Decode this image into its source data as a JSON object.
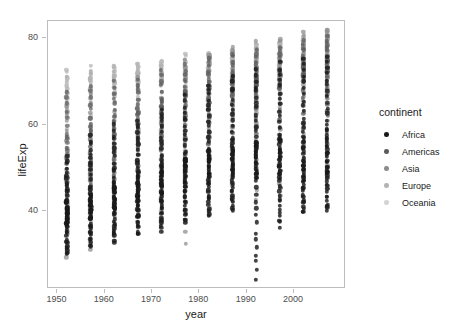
{
  "chart_data": {
    "type": "scatter",
    "title": "",
    "xlabel": "year",
    "ylabel": "lifeExp",
    "xlim": [
      1948,
      2011
    ],
    "ylim": [
      22,
      84
    ],
    "xticks": [
      1950,
      1960,
      1970,
      1980,
      1990,
      2000
    ],
    "yticks": [
      40,
      60,
      80
    ],
    "grid": false,
    "legend": {
      "position": "right",
      "title": "continent",
      "entries": [
        {
          "label": "Africa",
          "color": "#1a1a1a"
        },
        {
          "label": "Americas",
          "color": "#5c5c5c"
        },
        {
          "label": "Asia",
          "color": "#8c8c8c"
        },
        {
          "label": "Europe",
          "color": "#b3b3b3"
        },
        {
          "label": "Oceania",
          "color": "#d4d4d4"
        }
      ]
    },
    "color_by": "continent",
    "x_values": [
      1952,
      1957,
      1962,
      1967,
      1972,
      1977,
      1982,
      1987,
      1992,
      1997,
      2002,
      2007
    ],
    "series": [
      {
        "name": "Africa",
        "color": "#1a1a1a",
        "points_per_year": 52,
        "year_stats": [
          {
            "year": 1952,
            "min": 30.0,
            "q1": 36.6,
            "median": 38.8,
            "q3": 42.4,
            "max": 52.7
          },
          {
            "year": 1957,
            "min": 31.6,
            "q1": 38.2,
            "median": 40.6,
            "q3": 44.4,
            "max": 58.1
          },
          {
            "year": 1962,
            "min": 32.8,
            "q1": 39.8,
            "median": 42.6,
            "q3": 46.6,
            "max": 60.2
          },
          {
            "year": 1967,
            "min": 34.1,
            "q1": 41.4,
            "median": 44.7,
            "q3": 48.6,
            "max": 61.6
          },
          {
            "year": 1972,
            "min": 35.4,
            "q1": 43.0,
            "median": 47.0,
            "q3": 50.5,
            "max": 64.3
          },
          {
            "year": 1977,
            "min": 36.8,
            "q1": 44.5,
            "median": 49.3,
            "q3": 52.4,
            "max": 67.1
          },
          {
            "year": 1982,
            "min": 38.4,
            "q1": 46.4,
            "median": 50.8,
            "q3": 54.0,
            "max": 69.9
          },
          {
            "year": 1987,
            "min": 39.9,
            "q1": 47.9,
            "median": 51.6,
            "q3": 55.4,
            "max": 71.9
          },
          {
            "year": 1992,
            "min": 23.6,
            "q1": 46.8,
            "median": 52.4,
            "q3": 56.4,
            "max": 73.6
          },
          {
            "year": 1997,
            "min": 36.1,
            "q1": 46.4,
            "median": 52.8,
            "q3": 57.2,
            "max": 74.8
          },
          {
            "year": 2002,
            "min": 39.2,
            "q1": 46.4,
            "median": 51.2,
            "q3": 58.3,
            "max": 75.7
          },
          {
            "year": 2007,
            "min": 39.6,
            "q1": 47.8,
            "median": 52.9,
            "q3": 59.4,
            "max": 76.4
          }
        ]
      },
      {
        "name": "Americas",
        "color": "#5c5c5c",
        "points_per_year": 25,
        "year_stats": [
          {
            "year": 1952,
            "min": 37.6,
            "q1": 45.3,
            "median": 53.3,
            "q3": 58.4,
            "max": 68.8
          },
          {
            "year": 1957,
            "min": 40.7,
            "q1": 48.1,
            "median": 56.1,
            "q3": 60.7,
            "max": 69.9
          },
          {
            "year": 1962,
            "min": 43.9,
            "q1": 50.9,
            "median": 58.3,
            "q3": 62.4,
            "max": 70.3
          },
          {
            "year": 1967,
            "min": 46.2,
            "q1": 53.9,
            "median": 60.5,
            "q3": 64.0,
            "max": 71.1
          },
          {
            "year": 1972,
            "min": 48.6,
            "q1": 56.8,
            "median": 63.4,
            "q3": 65.6,
            "max": 72.9
          },
          {
            "year": 1977,
            "min": 50.0,
            "q1": 59.5,
            "median": 66.4,
            "q3": 67.7,
            "max": 74.2
          },
          {
            "year": 1982,
            "min": 51.5,
            "q1": 62.0,
            "median": 67.4,
            "q3": 69.6,
            "max": 75.8
          },
          {
            "year": 1987,
            "min": 53.6,
            "q1": 64.5,
            "median": 69.5,
            "q3": 71.1,
            "max": 76.9
          },
          {
            "year": 1992,
            "min": 55.1,
            "q1": 66.7,
            "median": 69.9,
            "q3": 72.1,
            "max": 77.9
          },
          {
            "year": 1997,
            "min": 56.7,
            "q1": 68.2,
            "median": 71.2,
            "q3": 73.4,
            "max": 78.6
          },
          {
            "year": 2002,
            "min": 58.1,
            "q1": 69.5,
            "median": 72.4,
            "q3": 74.9,
            "max": 79.8
          },
          {
            "year": 2007,
            "min": 60.9,
            "q1": 71.0,
            "median": 72.9,
            "q3": 76.4,
            "max": 80.7
          }
        ]
      },
      {
        "name": "Asia",
        "color": "#8c8c8c",
        "points_per_year": 33,
        "year_stats": [
          {
            "year": 1952,
            "min": 28.8,
            "q1": 38.9,
            "median": 44.9,
            "q3": 49.4,
            "max": 65.4
          },
          {
            "year": 1957,
            "min": 30.3,
            "q1": 41.2,
            "median": 48.3,
            "q3": 52.5,
            "max": 67.8
          },
          {
            "year": 1962,
            "min": 32.0,
            "q1": 43.6,
            "median": 49.3,
            "q3": 55.0,
            "max": 69.4
          },
          {
            "year": 1967,
            "min": 34.0,
            "q1": 46.0,
            "median": 53.7,
            "q3": 57.7,
            "max": 71.4
          },
          {
            "year": 1972,
            "min": 36.1,
            "q1": 48.8,
            "median": 56.9,
            "q3": 60.8,
            "max": 73.4
          },
          {
            "year": 1977,
            "min": 31.2,
            "q1": 51.7,
            "median": 60.8,
            "q3": 63.7,
            "max": 75.4
          },
          {
            "year": 1982,
            "min": 39.9,
            "q1": 54.9,
            "median": 63.7,
            "q3": 66.6,
            "max": 77.1
          },
          {
            "year": 1987,
            "min": 40.8,
            "q1": 57.8,
            "median": 66.3,
            "q3": 68.8,
            "max": 78.7
          },
          {
            "year": 1992,
            "min": 41.7,
            "q1": 60.5,
            "median": 68.7,
            "q3": 70.7,
            "max": 79.4
          },
          {
            "year": 1997,
            "min": 42.6,
            "q1": 62.9,
            "median": 70.3,
            "q3": 72.1,
            "max": 80.7
          },
          {
            "year": 2002,
            "min": 43.6,
            "q1": 64.6,
            "median": 71.0,
            "q3": 73.8,
            "max": 82.0
          },
          {
            "year": 2007,
            "min": 43.8,
            "q1": 65.5,
            "median": 72.4,
            "q3": 75.6,
            "max": 82.6
          }
        ]
      },
      {
        "name": "Europe",
        "color": "#b3b3b3",
        "points_per_year": 30,
        "year_stats": [
          {
            "year": 1952,
            "min": 43.6,
            "q1": 61.6,
            "median": 65.0,
            "q3": 69.2,
            "max": 72.7
          },
          {
            "year": 1957,
            "min": 48.1,
            "q1": 64.4,
            "median": 67.6,
            "q3": 70.7,
            "max": 73.5
          },
          {
            "year": 1962,
            "min": 52.1,
            "q1": 66.6,
            "median": 69.5,
            "q3": 71.4,
            "max": 73.7
          },
          {
            "year": 1967,
            "min": 54.3,
            "q1": 68.2,
            "median": 70.6,
            "q3": 71.9,
            "max": 74.2
          },
          {
            "year": 1972,
            "min": 57.0,
            "q1": 69.3,
            "median": 70.9,
            "q3": 72.5,
            "max": 74.7
          },
          {
            "year": 1977,
            "min": 59.5,
            "q1": 70.3,
            "median": 72.3,
            "q3": 73.4,
            "max": 76.1
          },
          {
            "year": 1982,
            "min": 61.0,
            "q1": 70.9,
            "median": 73.5,
            "q3": 74.5,
            "max": 77.1
          },
          {
            "year": 1987,
            "min": 63.1,
            "q1": 71.6,
            "median": 74.4,
            "q3": 75.5,
            "max": 77.8
          },
          {
            "year": 1992,
            "min": 66.1,
            "q1": 72.0,
            "median": 74.4,
            "q3": 76.5,
            "max": 78.8
          },
          {
            "year": 1997,
            "min": 68.8,
            "q1": 72.8,
            "median": 75.0,
            "q3": 77.8,
            "max": 79.4
          },
          {
            "year": 2002,
            "min": 70.8,
            "q1": 74.1,
            "median": 76.5,
            "q3": 78.8,
            "max": 80.2
          },
          {
            "year": 2007,
            "min": 71.8,
            "q1": 75.0,
            "median": 77.6,
            "q3": 79.8,
            "max": 81.8
          }
        ]
      },
      {
        "name": "Oceania",
        "color": "#d4d4d4",
        "points_per_year": 2,
        "year_stats": [
          {
            "year": 1952,
            "min": 69.1,
            "q1": 69.2,
            "median": 69.3,
            "q3": 69.3,
            "max": 69.4
          },
          {
            "year": 1957,
            "min": 70.3,
            "q1": 70.3,
            "median": 70.3,
            "q3": 70.3,
            "max": 70.3
          },
          {
            "year": 1962,
            "min": 70.9,
            "q1": 71.0,
            "median": 71.1,
            "q3": 71.1,
            "max": 71.2
          },
          {
            "year": 1967,
            "min": 71.1,
            "q1": 71.2,
            "median": 71.3,
            "q3": 71.4,
            "max": 71.5
          },
          {
            "year": 1972,
            "min": 71.2,
            "q1": 71.4,
            "median": 71.5,
            "q3": 71.7,
            "max": 71.9
          },
          {
            "year": 1977,
            "min": 72.2,
            "q1": 72.6,
            "median": 72.9,
            "q3": 73.2,
            "max": 73.5
          },
          {
            "year": 1982,
            "min": 73.8,
            "q1": 74.0,
            "median": 74.3,
            "q3": 74.5,
            "max": 74.8
          },
          {
            "year": 1987,
            "min": 74.3,
            "q1": 74.5,
            "median": 74.7,
            "q3": 74.9,
            "max": 75.2
          },
          {
            "year": 1992,
            "min": 76.3,
            "q1": 76.6,
            "median": 76.9,
            "q3": 77.2,
            "max": 77.6
          },
          {
            "year": 1997,
            "min": 77.6,
            "q1": 77.8,
            "median": 78.1,
            "q3": 78.4,
            "max": 78.8
          },
          {
            "year": 2002,
            "min": 79.1,
            "q1": 79.4,
            "median": 79.7,
            "q3": 80.0,
            "max": 80.4
          },
          {
            "year": 2007,
            "min": 80.2,
            "q1": 80.5,
            "median": 80.9,
            "q3": 81.2,
            "max": 81.2
          }
        ]
      }
    ]
  }
}
